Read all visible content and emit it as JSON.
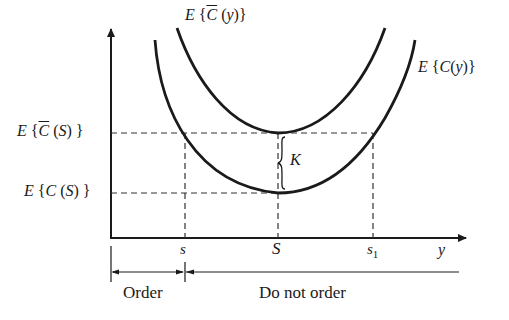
{
  "figure": {
    "curves": {
      "upper": {
        "label": "E {C̄ (y)}",
        "label_main": "E {",
        "label_c": "C",
        "label_tail": " (y)}"
      },
      "lower": {
        "label": "E {C(y)}"
      }
    },
    "y_axis_labels": {
      "upper_level": {
        "label": "E {C̄ (S)}",
        "pre": "E {",
        "c": "C",
        "post": " (S) }"
      },
      "lower_level": {
        "label": "E {C(S)}"
      }
    },
    "x_axis": {
      "label": "y",
      "ticks": [
        {
          "id": "s",
          "label": "s"
        },
        {
          "id": "S",
          "label": "S"
        },
        {
          "id": "s1",
          "label": "s",
          "subscript": "1"
        }
      ]
    },
    "gap_label": "K",
    "regions": {
      "order": "Order",
      "do_not_order": "Do not order"
    },
    "colors": {
      "ink": "#1a1a1a",
      "background": "#ffffff"
    }
  }
}
